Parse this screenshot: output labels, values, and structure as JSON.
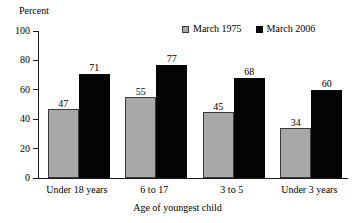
{
  "chart_data": {
    "type": "bar",
    "title": "",
    "xlabel": "Age of youngest child",
    "ylabel": "Percent",
    "ylim": [
      0,
      100
    ],
    "yticks": [
      0,
      20,
      40,
      60,
      80,
      100
    ],
    "grid": false,
    "legend_position": "top-right",
    "categories": [
      "Under 18 years",
      "6 to 17",
      "3 to 5",
      "Under 3 years"
    ],
    "series": [
      {
        "name": "March 1975",
        "color": "#a8a8a8",
        "values": [
          47,
          55,
          45,
          34
        ]
      },
      {
        "name": "March 2006",
        "color": "#040404",
        "values": [
          71,
          77,
          68,
          60
        ]
      }
    ]
  },
  "axis": {
    "y_unit_label": "Percent",
    "tick_labels": [
      "100",
      "80",
      "60",
      "40",
      "20",
      "0"
    ],
    "x_title": "Age of youngest child"
  },
  "legend": {
    "items": [
      {
        "label": "March 1975",
        "swatch": "gray-square-swatch"
      },
      {
        "label": "March 2006",
        "swatch": "black-square-swatch"
      }
    ]
  }
}
